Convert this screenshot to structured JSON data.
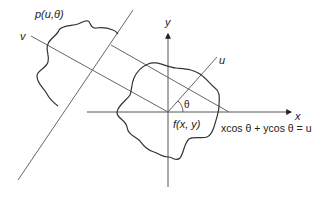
{
  "diagram": {
    "labels": {
      "projection": "p(u,θ)",
      "v_axis": "v",
      "y_axis": "y",
      "u_axis": "u",
      "x_axis": "x",
      "angle": "θ",
      "function": "f(x, y)",
      "equation": "xcos θ + ycos θ = u"
    },
    "colors": {
      "stroke": "#333333",
      "thin_line": "#666666",
      "background": "#ffffff"
    }
  }
}
